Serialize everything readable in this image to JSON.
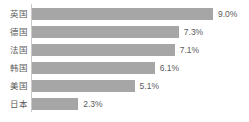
{
  "chart_data": {
    "type": "bar",
    "orientation": "horizontal",
    "title": "",
    "subtitle": "",
    "xlabel": "",
    "ylabel": "",
    "categories": [
      "英国",
      "德国",
      "法国",
      "韩国",
      "美国",
      "日本"
    ],
    "values": [
      9.0,
      7.3,
      7.1,
      6.1,
      5.1,
      2.3
    ],
    "value_labels": [
      "9.0%",
      "7.3%",
      "7.1%",
      "6.1%",
      "5.1%",
      "2.3%"
    ],
    "unit": "%",
    "xlim": [
      0,
      9.0
    ],
    "grid": false,
    "legend": false,
    "legend_position": "none",
    "bar_color": "#a6a6a6",
    "text_color": "#5a5a5a",
    "axis_color": "#c9c9c9",
    "background_color": "#ffffff"
  }
}
